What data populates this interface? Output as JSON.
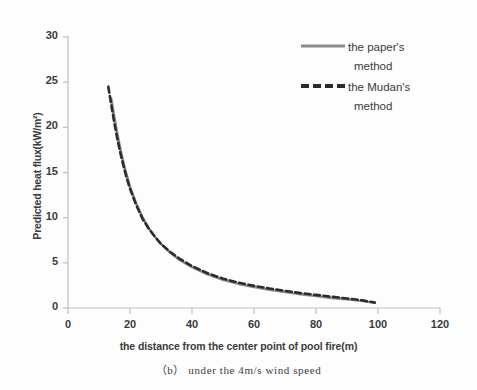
{
  "chart_data": {
    "type": "line",
    "title": "",
    "xlabel": "the distance from the center point of pool fire(m)",
    "ylabel": "Predicted heat flux(kW/m²)",
    "caption": "（b） under the  4m/s wind speed",
    "xlim": [
      0,
      120
    ],
    "ylim": [
      0,
      30
    ],
    "xticks": [
      "0",
      "20",
      "40",
      "60",
      "80",
      "100",
      "120"
    ],
    "yticks": [
      "0",
      "5",
      "10",
      "15",
      "20",
      "25",
      "30"
    ],
    "xtick_values": [
      0,
      20,
      40,
      60,
      80,
      100,
      120
    ],
    "ytick_values": [
      0,
      5,
      10,
      15,
      20,
      25,
      30
    ],
    "grid": false,
    "legend_position": "top-right",
    "series": [
      {
        "name": "the paper's method",
        "style": "solid",
        "color": "#8c8c8c",
        "width": 2.2,
        "x": [
          14,
          15,
          16,
          17,
          18,
          19,
          20,
          22,
          24,
          26,
          28,
          30,
          33,
          36,
          40,
          45,
          50,
          55,
          60,
          65,
          70,
          75,
          80,
          85,
          90,
          95,
          99
        ],
        "y": [
          23.2,
          21.1,
          19.2,
          17.5,
          16.0,
          14.7,
          13.5,
          11.6,
          10.1,
          8.9,
          7.9,
          7.1,
          6.1,
          5.3,
          4.5,
          3.7,
          3.1,
          2.65,
          2.3,
          2.0,
          1.75,
          1.5,
          1.3,
          1.1,
          0.95,
          0.75,
          0.55
        ]
      },
      {
        "name": "the Mudan's method",
        "style": "dashed",
        "color": "#2b2b2b",
        "width": 2.6,
        "x": [
          13,
          14,
          15,
          16,
          17,
          18,
          19,
          20,
          22,
          24,
          26,
          28,
          30,
          33,
          36,
          40,
          45,
          50,
          55,
          60,
          65,
          70,
          75,
          80,
          85,
          90,
          95,
          99
        ],
        "y": [
          24.5,
          22.4,
          20.4,
          18.6,
          17.0,
          15.6,
          14.3,
          13.2,
          11.4,
          9.9,
          8.8,
          7.9,
          7.1,
          6.2,
          5.45,
          4.65,
          3.85,
          3.25,
          2.8,
          2.45,
          2.15,
          1.9,
          1.65,
          1.45,
          1.25,
          1.05,
          0.85,
          0.6
        ]
      }
    ]
  },
  "legend": {
    "entries": [
      {
        "line1": "the paper's",
        "line2": "method"
      },
      {
        "line1": "the Mudan's",
        "line2": "method"
      }
    ]
  },
  "colors": {
    "paper_method": "#8c8c8c",
    "mudan_method": "#2b2b2b",
    "axis": "#bfbfbf",
    "text": "#3b3b3b",
    "background": "#fdfdfd"
  }
}
